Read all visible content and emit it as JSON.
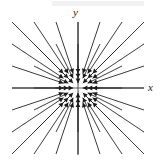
{
  "figure": {
    "title": "",
    "background_color": "#ffffff",
    "width": 164,
    "height": 162
  },
  "axes": {
    "x_label": "x",
    "y_label": "y",
    "axis_color": "#5a5a5a",
    "origin_px": {
      "x": 78,
      "y": 88
    },
    "x_axis_extent_px": {
      "start": 12,
      "end": 144
    },
    "y_axis_extent_px": {
      "start": 22,
      "end": 155
    }
  },
  "arrows": {
    "color": "#262626",
    "head_color": "#1a1a1a",
    "line_width": 0.9,
    "spacing_px": 22,
    "scale": 0.78
  },
  "chart_data": {
    "type": "scatter",
    "subtype": "vector-field",
    "title": "",
    "xlabel": "x",
    "ylabel": "y",
    "xlim": [
      -3,
      3
    ],
    "ylim": [
      -3,
      3
    ],
    "grid": false,
    "legend": null,
    "field_expression": "F(x, y) = (-x, -y)",
    "x": [
      -3,
      -2,
      -1,
      0,
      1,
      2,
      3
    ],
    "y": [
      -3,
      -2,
      -1,
      0,
      1,
      2,
      3
    ],
    "vectors": [
      {
        "x": -3,
        "y": 3,
        "u": 3,
        "v": -3
      },
      {
        "x": -2,
        "y": 3,
        "u": 2,
        "v": -3
      },
      {
        "x": -1,
        "y": 3,
        "u": 1,
        "v": -3
      },
      {
        "x": 0,
        "y": 3,
        "u": 0,
        "v": -3
      },
      {
        "x": 1,
        "y": 3,
        "u": -1,
        "v": -3
      },
      {
        "x": 2,
        "y": 3,
        "u": -2,
        "v": -3
      },
      {
        "x": 3,
        "y": 3,
        "u": -3,
        "v": -3
      },
      {
        "x": -3,
        "y": 2,
        "u": 3,
        "v": -2
      },
      {
        "x": -2,
        "y": 2,
        "u": 2,
        "v": -2
      },
      {
        "x": -1,
        "y": 2,
        "u": 1,
        "v": -2
      },
      {
        "x": 0,
        "y": 2,
        "u": 0,
        "v": -2
      },
      {
        "x": 1,
        "y": 2,
        "u": -1,
        "v": -2
      },
      {
        "x": 2,
        "y": 2,
        "u": -2,
        "v": -2
      },
      {
        "x": 3,
        "y": 2,
        "u": -3,
        "v": -2
      },
      {
        "x": -3,
        "y": 1,
        "u": 3,
        "v": -1
      },
      {
        "x": -2,
        "y": 1,
        "u": 2,
        "v": -1
      },
      {
        "x": -1,
        "y": 1,
        "u": 1,
        "v": -1
      },
      {
        "x": 0,
        "y": 1,
        "u": 0,
        "v": -1
      },
      {
        "x": 1,
        "y": 1,
        "u": -1,
        "v": -1
      },
      {
        "x": 2,
        "y": 1,
        "u": -2,
        "v": -1
      },
      {
        "x": 3,
        "y": 1,
        "u": -3,
        "v": -1
      },
      {
        "x": -3,
        "y": 0,
        "u": 3,
        "v": 0
      },
      {
        "x": -2,
        "y": 0,
        "u": 2,
        "v": 0
      },
      {
        "x": -1,
        "y": 0,
        "u": 1,
        "v": 0
      },
      {
        "x": 1,
        "y": 0,
        "u": -1,
        "v": 0
      },
      {
        "x": 2,
        "y": 0,
        "u": -2,
        "v": 0
      },
      {
        "x": 3,
        "y": 0,
        "u": -3,
        "v": 0
      },
      {
        "x": -3,
        "y": -1,
        "u": 3,
        "v": 1
      },
      {
        "x": -2,
        "y": -1,
        "u": 2,
        "v": 1
      },
      {
        "x": -1,
        "y": -1,
        "u": 1,
        "v": 1
      },
      {
        "x": 0,
        "y": -1,
        "u": 0,
        "v": 1
      },
      {
        "x": 1,
        "y": -1,
        "u": -1,
        "v": 1
      },
      {
        "x": 2,
        "y": -1,
        "u": -2,
        "v": 1
      },
      {
        "x": 3,
        "y": -1,
        "u": -3,
        "v": 1
      },
      {
        "x": -3,
        "y": -2,
        "u": 3,
        "v": 2
      },
      {
        "x": -2,
        "y": -2,
        "u": 2,
        "v": 2
      },
      {
        "x": -1,
        "y": -2,
        "u": 1,
        "v": 2
      },
      {
        "x": 0,
        "y": -2,
        "u": 0,
        "v": 2
      },
      {
        "x": 1,
        "y": -2,
        "u": -1,
        "v": 2
      },
      {
        "x": 2,
        "y": -2,
        "u": -2,
        "v": 2
      },
      {
        "x": 3,
        "y": -2,
        "u": -3,
        "v": 2
      },
      {
        "x": -3,
        "y": -3,
        "u": 3,
        "v": 3
      },
      {
        "x": -2,
        "y": -3,
        "u": 2,
        "v": 3
      },
      {
        "x": -1,
        "y": -3,
        "u": 1,
        "v": 3
      },
      {
        "x": 0,
        "y": -3,
        "u": 0,
        "v": 3
      },
      {
        "x": 1,
        "y": -3,
        "u": -1,
        "v": 3
      },
      {
        "x": 2,
        "y": -3,
        "u": -2,
        "v": 3
      },
      {
        "x": 3,
        "y": -3,
        "u": -3,
        "v": 3
      }
    ]
  }
}
